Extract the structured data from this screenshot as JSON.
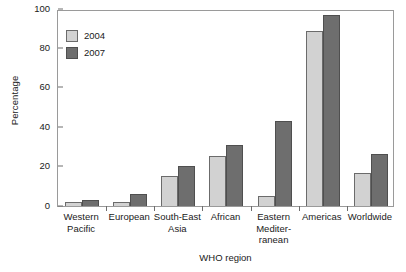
{
  "chart_data": {
    "type": "bar",
    "title": "",
    "xlabel": "WHO region",
    "ylabel": "Percentage",
    "ylim": [
      0,
      100
    ],
    "yticks": [
      0,
      20,
      40,
      60,
      80,
      100
    ],
    "grid": false,
    "legend_position": "top-left",
    "categories": [
      "Western\nPacific",
      "European",
      "South-East\nAsia",
      "African",
      "Eastern\nMediter-\nranean",
      "Americas",
      "Worldwide"
    ],
    "series": [
      {
        "name": "2004",
        "color": "#d2d2d2",
        "values": [
          2,
          2,
          15,
          25.5,
          5,
          89,
          17
        ]
      },
      {
        "name": "2007",
        "color": "#6e6e6e",
        "values": [
          3,
          6,
          20.5,
          31,
          43,
          97,
          26.5
        ]
      }
    ]
  },
  "legend": {
    "items": [
      {
        "label": "2004",
        "color": "#d2d2d2"
      },
      {
        "label": "2007",
        "color": "#6e6e6e"
      }
    ]
  },
  "axis": {
    "y_title": "Percentage",
    "x_title": "WHO region",
    "y_tick_labels": [
      "100",
      "80",
      "60",
      "40",
      "20",
      "0"
    ]
  }
}
